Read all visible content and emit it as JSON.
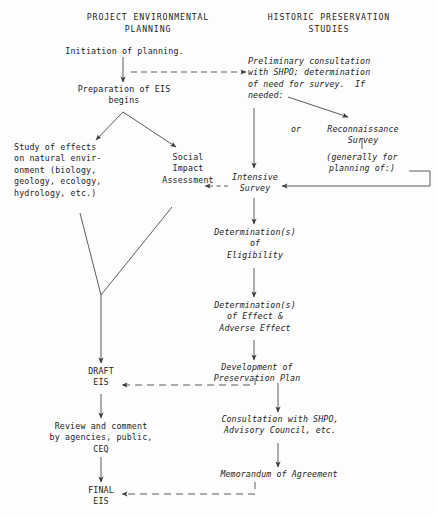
{
  "diagram": {
    "headers": [
      {
        "id": "left-column-header",
        "text": "PROJECT ENVIRONMENTAL\nPLANNING"
      },
      {
        "id": "right-column-header",
        "text": "HISTORIC PRESERVATION\nSTUDIES"
      }
    ],
    "left_column": [
      {
        "id": "initiation-of-planning",
        "text": "Initiation of planning."
      },
      {
        "id": "preparation-of-eis",
        "text": "Preparation of EIS\nbegins"
      },
      {
        "id": "study-of-effects",
        "text": "Study of effects\non natural envir-\nonment (biology,\ngeology, ecology,\nhydrology, etc.)"
      },
      {
        "id": "social-impact-assessment",
        "text": "Social\nImpact\nAssessment"
      },
      {
        "id": "draft-eis",
        "text": "DRAFT\nEIS"
      },
      {
        "id": "review-and-comment",
        "text": "Review and comment\nby agencies, public,\nCEQ"
      },
      {
        "id": "final-eis",
        "text": "FINAL\nEIS"
      }
    ],
    "right_column": [
      {
        "id": "preliminary-consultation",
        "text": "Preliminary consultation\nwith SHPO; determination\nof need for survey.  If\nneeded:"
      },
      {
        "id": "or-connector",
        "text": "or"
      },
      {
        "id": "reconnaissance-survey",
        "text": "Reconnaissance\nSurvey"
      },
      {
        "id": "generally-for-planning",
        "text": "(generally for\nplanning of:)"
      },
      {
        "id": "intensive-survey",
        "text": "Intensive\nSurvey"
      },
      {
        "id": "determinations-eligibility",
        "text": "Determination(s)\nof\nEligibility"
      },
      {
        "id": "determinations-effect",
        "text": "Determination(s)\nof Effect &\nAdverse Effect"
      },
      {
        "id": "development-preservation",
        "text": "Development of\nPreservation Plan"
      },
      {
        "id": "consultation-shpo",
        "text": "Consultation with SHPO,\nAdvisory Council, etc."
      },
      {
        "id": "memorandum-of-agreement",
        "text": "Memorandum of Agreement"
      }
    ],
    "colors": {
      "ink": "#232323",
      "line": "#4a4a4a",
      "background": "#fdfdfd"
    }
  }
}
